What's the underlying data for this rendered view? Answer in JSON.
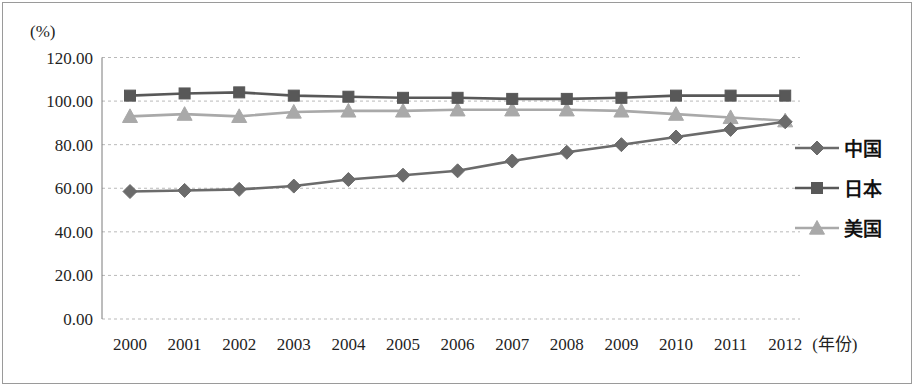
{
  "chart_data": {
    "type": "line",
    "title": "",
    "xlabel": "(年份)",
    "ylabel": "(%)",
    "ylim": [
      0,
      120
    ],
    "ytick_step": 20,
    "grid": true,
    "legend_position": "right",
    "categories": [
      "2000",
      "2001",
      "2002",
      "2003",
      "2004",
      "2005",
      "2006",
      "2007",
      "2008",
      "2009",
      "2010",
      "2011",
      "2012"
    ],
    "yticks": [
      "0.00",
      "20.00",
      "40.00",
      "60.00",
      "80.00",
      "100.00",
      "120.00"
    ],
    "series": [
      {
        "name": "中国",
        "marker": "diamond",
        "color": "#6b6b6b",
        "values": [
          58.5,
          59.0,
          59.5,
          61.0,
          64.0,
          66.0,
          68.0,
          72.5,
          76.5,
          80.0,
          83.5,
          87.0,
          90.5
        ]
      },
      {
        "name": "日本",
        "marker": "square",
        "color": "#585858",
        "values": [
          102.5,
          103.5,
          104.0,
          102.5,
          102.0,
          101.5,
          101.5,
          101.0,
          101.0,
          101.5,
          102.5,
          102.5,
          102.5
        ]
      },
      {
        "name": "美国",
        "marker": "triangle",
        "color": "#a9a9a9",
        "values": [
          93.0,
          94.0,
          93.0,
          95.0,
          95.5,
          95.5,
          96.0,
          96.0,
          96.0,
          95.5,
          94.0,
          92.5,
          91.0
        ]
      }
    ]
  },
  "legend": {
    "items": [
      {
        "label": "中国"
      },
      {
        "label": "日本"
      },
      {
        "label": "美国"
      }
    ]
  },
  "axes": {
    "y_unit_label": "(%)",
    "x_unit_label": "(年份)"
  }
}
